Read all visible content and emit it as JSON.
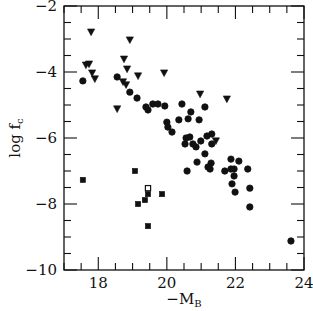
{
  "chart_data": {
    "type": "scatter",
    "title": "",
    "xlabel": "−M_B",
    "ylabel": "log f_c",
    "xlabel_parts": {
      "main": "−M",
      "sub": "B"
    },
    "ylabel_parts": {
      "main": "log f",
      "sub": "c"
    },
    "xlim": [
      17,
      24
    ],
    "ylim": [
      -10,
      -2
    ],
    "xticks": [
      18,
      20,
      22,
      24
    ],
    "xtick_labels": [
      "18",
      "20",
      "22",
      "24"
    ],
    "yticks": [
      -2,
      -4,
      -6,
      -8,
      -10
    ],
    "ytick_labels": [
      "−2",
      "−4",
      "−6",
      "−8",
      "−10"
    ],
    "x_minor_step": 0.5,
    "y_minor_step": 0.5,
    "grid": false,
    "legend": null,
    "series": [
      {
        "name": "filled circles",
        "marker": "circle",
        "filled": true,
        "points": [
          [
            17.55,
            -4.27
          ],
          [
            18.55,
            -4.15
          ],
          [
            18.92,
            -4.61
          ],
          [
            19.13,
            -4.79
          ],
          [
            19.39,
            -5.06
          ],
          [
            19.45,
            -5.15
          ],
          [
            19.59,
            -4.97
          ],
          [
            19.74,
            -4.97
          ],
          [
            19.94,
            -5.03
          ],
          [
            20.44,
            -4.97
          ],
          [
            21.11,
            -5.06
          ],
          [
            20.7,
            -5.21
          ],
          [
            20.35,
            -5.45
          ],
          [
            20.62,
            -5.42
          ],
          [
            20.94,
            -5.45
          ],
          [
            20.0,
            -5.52
          ],
          [
            20.03,
            -5.67
          ],
          [
            20.15,
            -5.82
          ],
          [
            20.56,
            -6.0
          ],
          [
            20.67,
            -5.97
          ],
          [
            20.53,
            -6.18
          ],
          [
            20.76,
            -6.18
          ],
          [
            20.85,
            -6.27
          ],
          [
            20.99,
            -6.09
          ],
          [
            21.17,
            -5.94
          ],
          [
            21.31,
            -5.88
          ],
          [
            21.31,
            -6.18
          ],
          [
            21.11,
            -6.48
          ],
          [
            20.88,
            -6.73
          ],
          [
            21.29,
            -6.76
          ],
          [
            21.2,
            -6.88
          ],
          [
            21.26,
            -6.94
          ],
          [
            20.59,
            -7.0
          ],
          [
            21.87,
            -6.64
          ],
          [
            22.1,
            -6.7
          ],
          [
            21.69,
            -7.0
          ],
          [
            21.87,
            -6.94
          ],
          [
            21.96,
            -6.94
          ],
          [
            22.36,
            -6.94
          ],
          [
            21.96,
            -7.15
          ],
          [
            21.9,
            -7.39
          ],
          [
            21.99,
            -7.64
          ],
          [
            22.42,
            -7.52
          ],
          [
            22.42,
            -8.09
          ],
          [
            23.62,
            -9.12
          ]
        ]
      },
      {
        "name": "filled triangles (upper limits)",
        "marker": "triangle-down",
        "filled": true,
        "points": [
          [
            17.79,
            -2.79
          ],
          [
            18.92,
            -3.03
          ],
          [
            17.64,
            -3.79
          ],
          [
            17.73,
            -3.76
          ],
          [
            18.75,
            -3.61
          ],
          [
            18.84,
            -3.91
          ],
          [
            17.82,
            -4.03
          ],
          [
            17.9,
            -4.21
          ],
          [
            19.16,
            -4.12
          ],
          [
            19.92,
            -4.03
          ],
          [
            18.72,
            -4.3
          ],
          [
            18.81,
            -4.39
          ],
          [
            18.55,
            -5.12
          ],
          [
            20.97,
            -4.67
          ],
          [
            21.75,
            -4.82
          ],
          [
            21.43,
            -6.09
          ]
        ]
      },
      {
        "name": "filled squares",
        "marker": "square",
        "filled": true,
        "points": [
          [
            17.55,
            -7.27
          ],
          [
            19.07,
            -7.0
          ],
          [
            19.45,
            -7.7
          ],
          [
            19.86,
            -7.7
          ],
          [
            19.36,
            -7.88
          ],
          [
            19.16,
            -8.0
          ],
          [
            19.45,
            -8.67
          ]
        ]
      },
      {
        "name": "open square",
        "marker": "square",
        "filled": false,
        "points": [
          [
            19.45,
            -7.52
          ]
        ]
      }
    ]
  },
  "colors": {
    "ink": "#111111",
    "background": "#ffffff"
  }
}
